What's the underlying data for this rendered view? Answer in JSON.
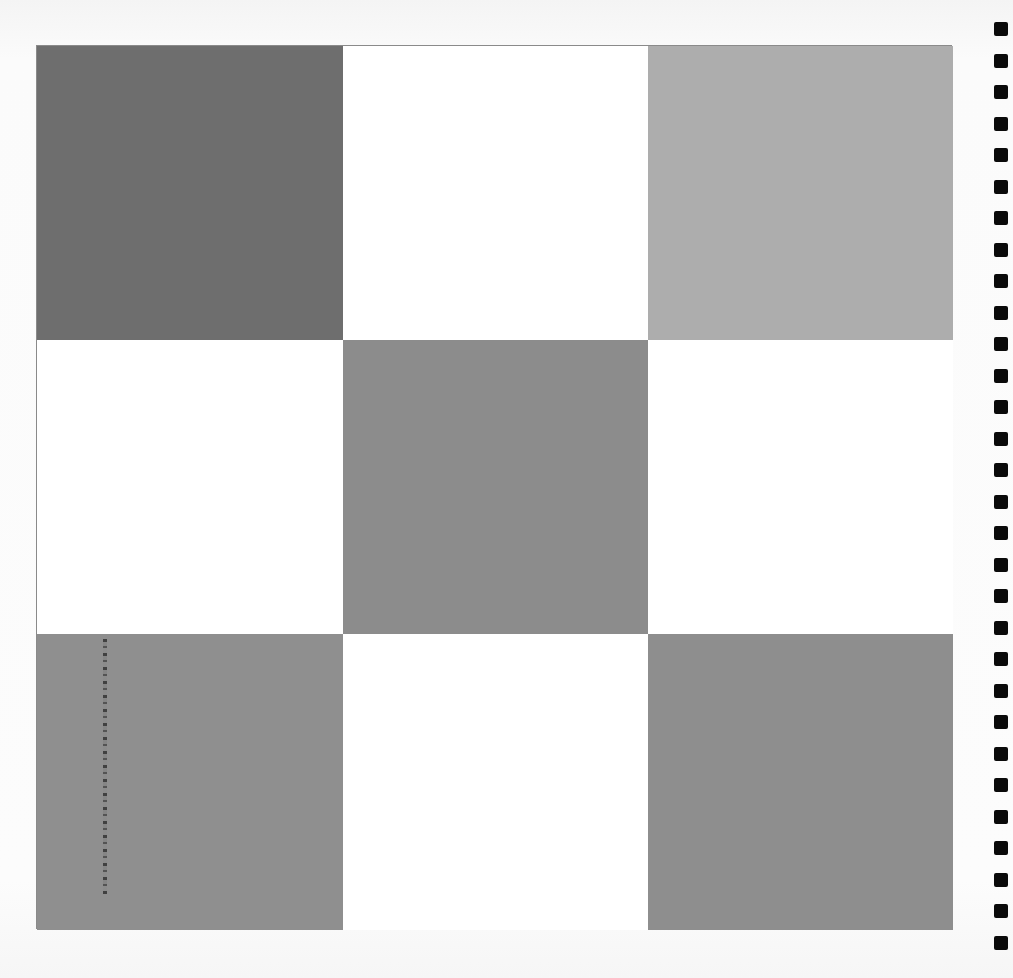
{
  "chart": {
    "rows": 3,
    "cols": 3,
    "cells": [
      {
        "row": 0,
        "col": 0,
        "shade": "dark-gray",
        "color": "#6e6e6e"
      },
      {
        "row": 0,
        "col": 1,
        "shade": "white",
        "color": "#ffffff"
      },
      {
        "row": 0,
        "col": 2,
        "shade": "light-gray",
        "color": "#adadad"
      },
      {
        "row": 1,
        "col": 0,
        "shade": "white",
        "color": "#ffffff"
      },
      {
        "row": 1,
        "col": 1,
        "shade": "medium-gray",
        "color": "#8c8c8c"
      },
      {
        "row": 1,
        "col": 2,
        "shade": "white",
        "color": "#ffffff"
      },
      {
        "row": 2,
        "col": 0,
        "shade": "medium-gray",
        "color": "#8f8f8f"
      },
      {
        "row": 2,
        "col": 1,
        "shade": "white",
        "color": "#ffffff"
      },
      {
        "row": 2,
        "col": 2,
        "shade": "medium-gray",
        "color": "#8e8e8e"
      }
    ]
  },
  "registration_marks": {
    "count": 30,
    "color": "#0a0a0a",
    "spacing_px": 31.5
  }
}
